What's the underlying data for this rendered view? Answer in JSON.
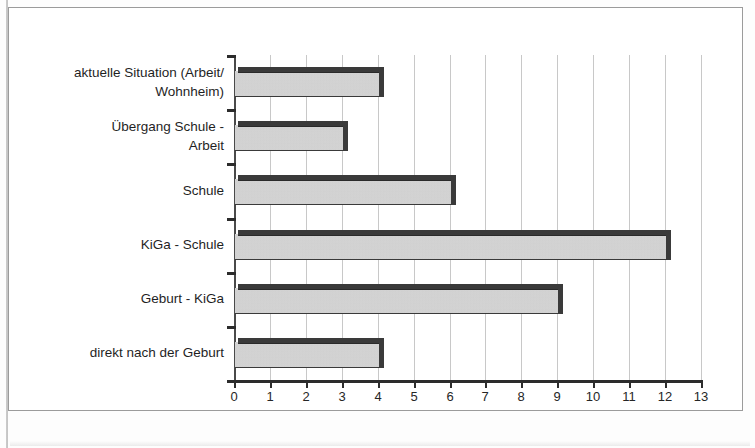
{
  "figure": {
    "frame_color": "#9b9b9b",
    "background": "#ffffff"
  },
  "chart_data": {
    "type": "bar",
    "orientation": "horizontal",
    "title": "",
    "subtitle": "",
    "xlabel": "",
    "ylabel": "",
    "xlim": [
      0,
      13
    ],
    "ylim": null,
    "grid": true,
    "legend": null,
    "legend_position": "none",
    "xticks": [
      "0",
      "1",
      "2",
      "3",
      "4",
      "5",
      "6",
      "7",
      "8",
      "9",
      "10",
      "11",
      "12",
      "13"
    ],
    "xtick_values": [
      0,
      1,
      2,
      3,
      4,
      5,
      6,
      7,
      8,
      9,
      10,
      11,
      12,
      13
    ],
    "categories": [
      "aktuelle Situation (Arbeit/ Wohnheim)",
      "Übergang Schule - Arbeit",
      "Schule",
      "KiGa - Schule",
      "Geburt - KiGa",
      "direkt nach der Geburt"
    ],
    "category_lines": [
      [
        "aktuelle Situation (Arbeit/",
        "Wohnheim)"
      ],
      [
        "Übergang Schule -",
        "Arbeit"
      ],
      [
        "Schule"
      ],
      [
        "KiGa - Schule"
      ],
      [
        "Geburt - KiGa"
      ],
      [
        "direkt nach der Geburt"
      ]
    ],
    "values": [
      4,
      3,
      6,
      12,
      9,
      4
    ],
    "bar_fill_color": "#d2d2d2",
    "bar_edge_color": "#3a3a3a",
    "gridline_color": "#c8c8c8",
    "axis_color": "#2c2c2c"
  }
}
